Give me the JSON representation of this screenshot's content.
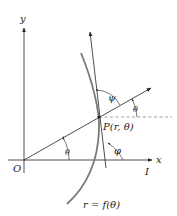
{
  "diagram": {
    "labels": {
      "y_axis": "y",
      "x_axis": "x",
      "origin": "O",
      "polar_axis": "I",
      "point": "P(r, θ)",
      "curve": "r = f(θ)",
      "theta_at_origin": "θ",
      "theta_at_point": "θ",
      "psi": "ψ",
      "phi": "φ"
    },
    "colors": {
      "stroke": "#222222",
      "curve": "#7a7a7a",
      "dashed": "#888888",
      "background": "#ffffff"
    }
  }
}
